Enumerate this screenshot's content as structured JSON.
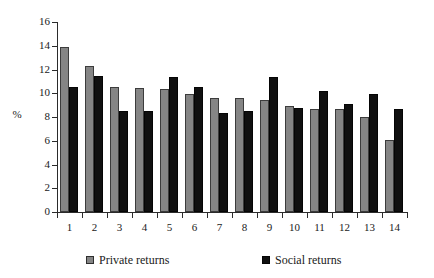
{
  "chart_data": {
    "type": "bar",
    "title": "",
    "xlabel": "",
    "ylabel": "%",
    "ylim": [
      0,
      16
    ],
    "ytick_step": 2,
    "yticks": [
      "16",
      "14",
      "12",
      "10",
      "8",
      "6",
      "4",
      "2",
      "0"
    ],
    "grid": false,
    "legend_position": "bottom",
    "categories": [
      "1",
      "2",
      "3",
      "4",
      "5",
      "6",
      "7",
      "8",
      "9",
      "10",
      "11",
      "12",
      "13",
      "14"
    ],
    "series": [
      {
        "name": "Private returns",
        "color": "#858585",
        "values": [
          13.9,
          12.3,
          10.5,
          10.45,
          10.4,
          9.9,
          9.6,
          9.6,
          9.4,
          8.9,
          8.7,
          8.7,
          8.0,
          6.05
        ]
      },
      {
        "name": "Social returns",
        "color": "#101010",
        "values": [
          10.5,
          11.45,
          8.5,
          8.5,
          11.4,
          10.55,
          8.3,
          8.5,
          11.4,
          8.75,
          10.2,
          9.1,
          9.95,
          8.65
        ]
      }
    ]
  },
  "legend": {
    "items": [
      {
        "label": "Private returns",
        "swatch": "private"
      },
      {
        "label": "Social returns",
        "swatch": "social"
      }
    ]
  }
}
